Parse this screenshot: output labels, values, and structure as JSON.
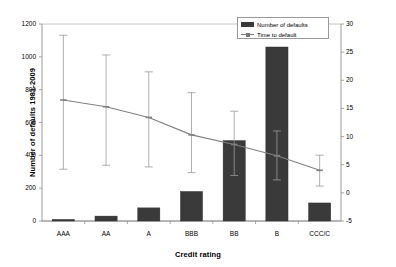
{
  "chart_data": {
    "type": "bar",
    "title": "",
    "xlabel": "Credit rating",
    "ylabel": "Number of defaults 1981-2009",
    "ylabel_right": "Time to default (years)",
    "categories": [
      "AAA",
      "AA",
      "A",
      "BBB",
      "BB",
      "B",
      "CCC/C"
    ],
    "ylim": [
      0,
      1200
    ],
    "yticks": [
      0,
      200,
      400,
      600,
      800,
      1000,
      1200
    ],
    "ylim_right": [
      -5,
      30
    ],
    "yticks_right": [
      -5,
      0,
      5,
      10,
      15,
      20,
      25,
      30
    ],
    "grid": false,
    "legend_position": "top-right",
    "series": [
      {
        "name": "Number of defaults",
        "type": "bar",
        "axis": "left",
        "color": "#3a3a3a",
        "values": [
          10,
          30,
          80,
          180,
          490,
          1060,
          110
        ]
      },
      {
        "name": "Time to default",
        "type": "line",
        "axis": "right",
        "color": "#808080",
        "values": [
          16.5,
          15.3,
          13.4,
          10.3,
          8.6,
          6.6,
          4.0
        ],
        "error_high": [
          28.0,
          24.5,
          21.5,
          17.8,
          14.5,
          11.0,
          6.7
        ],
        "error_low": [
          4.2,
          4.9,
          4.6,
          3.6,
          3.1,
          2.3,
          1.2
        ]
      }
    ]
  },
  "legend": {
    "items": [
      {
        "label": "Number of defaults",
        "marker": "bar-swatch"
      },
      {
        "label": "Time to default",
        "marker": "line-swatch"
      }
    ]
  }
}
